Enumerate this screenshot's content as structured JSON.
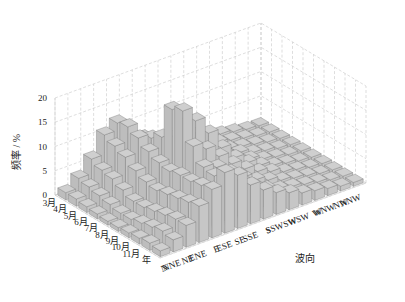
{
  "chart_data": {
    "type": "bar3d",
    "title": "",
    "zlabel": "频率 / %",
    "xlabel": "波向",
    "ylabel": "",
    "zlim": [
      0,
      20
    ],
    "zticks": [
      0,
      5,
      10,
      15,
      20
    ],
    "months": [
      "3月",
      "4月",
      "5月",
      "6月",
      "7月",
      "8月",
      "9月",
      "10月",
      "11月",
      "年"
    ],
    "directions": [
      "N",
      "NNE",
      "NE",
      "ENE",
      "E",
      "ESE",
      "SE",
      "SSE",
      "S",
      "SSW",
      "SW",
      "WSW",
      "W",
      "WNW",
      "NW",
      "NNW"
    ],
    "grid": true,
    "values": [
      [
        1.5,
        3.5,
        6.5,
        10.5,
        12.0,
        8.5,
        7.0,
        4.5,
        3.5,
        3.0,
        2.5,
        2.5,
        2.0,
        1.5,
        1.0,
        0.8
      ],
      [
        1.5,
        3.0,
        5.5,
        9.5,
        12.5,
        9.0,
        7.5,
        5.0,
        4.0,
        3.0,
        2.5,
        2.5,
        2.0,
        1.5,
        1.0,
        0.8
      ],
      [
        1.2,
        2.5,
        5.0,
        8.5,
        11.5,
        10.5,
        9.0,
        6.0,
        4.5,
        3.5,
        3.0,
        2.5,
        2.0,
        1.5,
        1.0,
        0.8
      ],
      [
        1.0,
        2.0,
        4.0,
        7.0,
        10.0,
        12.0,
        11.0,
        8.0,
        6.0,
        4.5,
        3.5,
        3.0,
        2.0,
        1.5,
        1.0,
        0.8
      ],
      [
        0.8,
        1.5,
        3.0,
        6.0,
        9.0,
        19.0,
        16.0,
        12.0,
        8.0,
        6.0,
        4.0,
        3.0,
        2.0,
        1.5,
        1.0,
        0.8
      ],
      [
        0.8,
        1.5,
        3.0,
        5.5,
        8.5,
        20.0,
        17.0,
        13.5,
        9.5,
        6.5,
        4.5,
        3.0,
        2.0,
        1.5,
        1.0,
        0.8
      ],
      [
        1.0,
        2.0,
        3.5,
        6.0,
        9.0,
        14.0,
        12.5,
        10.0,
        7.5,
        5.5,
        4.0,
        3.0,
        2.0,
        1.5,
        1.0,
        0.8
      ],
      [
        1.2,
        2.5,
        4.0,
        6.5,
        9.0,
        11.0,
        10.0,
        8.0,
        6.0,
        4.5,
        3.5,
        2.5,
        2.0,
        1.5,
        1.0,
        0.8
      ],
      [
        1.5,
        3.0,
        4.5,
        7.0,
        9.5,
        10.5,
        9.5,
        7.5,
        5.5,
        4.0,
        3.0,
        2.5,
        2.0,
        1.5,
        1.0,
        0.8
      ],
      [
        1.2,
        2.5,
        4.5,
        7.5,
        10.0,
        12.5,
        11.0,
        8.0,
        6.0,
        4.5,
        3.5,
        2.5,
        2.0,
        1.5,
        1.0,
        0.8
      ]
    ]
  },
  "labels": {
    "zlabel": "频率 / %",
    "xlabel": "波向"
  }
}
